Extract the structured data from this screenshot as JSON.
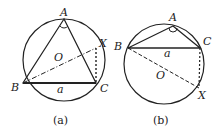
{
  "figures": [
    {
      "id": "a",
      "caption": "(a)",
      "labels": {
        "A": "A",
        "B": "B",
        "C": "C",
        "X": "X",
        "O": "O",
        "side": "a"
      }
    },
    {
      "id": "b",
      "caption": "(b)",
      "labels": {
        "A": "A",
        "B": "B",
        "C": "C",
        "X": "X",
        "O": "O",
        "side": "a"
      }
    }
  ],
  "colors": {
    "stroke": "#222222",
    "background": "#ffffff"
  }
}
